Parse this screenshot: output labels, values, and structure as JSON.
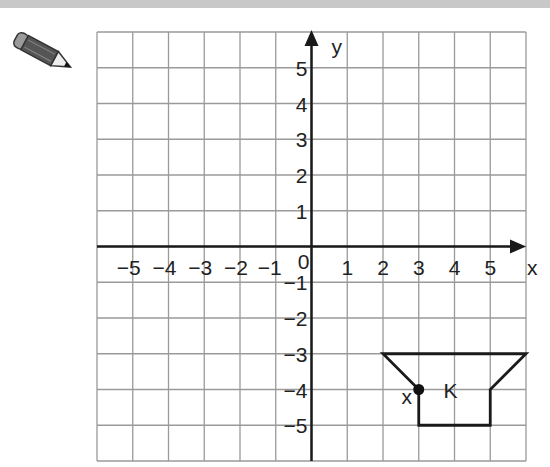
{
  "header": {
    "bar_color": "#c8c8c8"
  },
  "icons": {
    "pencil": "pencil-icon"
  },
  "chart_data": {
    "type": "coordinate-grid",
    "title": "",
    "xlabel": "x",
    "ylabel": "y",
    "xlim": [
      -6,
      6
    ],
    "ylim": [
      -6,
      6
    ],
    "grid": true,
    "x_tick_labels": [
      "-5",
      "-4",
      "-3",
      "-2",
      "-1",
      "0",
      "1",
      "2",
      "3",
      "4",
      "5"
    ],
    "y_tick_labels": [
      "5",
      "4",
      "3",
      "2",
      "1",
      "-1",
      "-2",
      "-3",
      "-4",
      "-5"
    ],
    "shapes": [
      {
        "name": "K",
        "label": "K",
        "label_position": [
          4,
          -4
        ],
        "vertices": [
          [
            2,
            -3
          ],
          [
            6,
            -3
          ],
          [
            5,
            -4
          ],
          [
            5,
            -5
          ],
          [
            3,
            -5
          ],
          [
            3,
            -4
          ]
        ]
      }
    ],
    "points": [
      {
        "label": "X",
        "x": 3,
        "y": -4
      }
    ]
  },
  "labels": {
    "x_axis": "x",
    "y_axis": "y",
    "origin": "0",
    "shape": "K",
    "point": "X"
  }
}
